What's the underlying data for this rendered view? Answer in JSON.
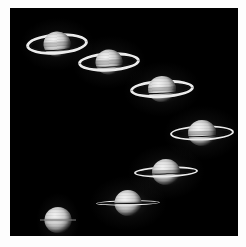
{
  "figure": {
    "kind": "astrophoto-montage",
    "orientation": "diagonal descending sequence",
    "plate_background_color": "#000000",
    "paper_background_color": "#fdfdfd",
    "plate": {
      "left": 10,
      "top": 8,
      "width": 228,
      "height": 228
    },
    "count": 7
  },
  "palette": {
    "sky": "#000000",
    "paper": "#fdfdfd",
    "globe_highlight": "#f2f2f2",
    "globe_midtone": "#c9c9c9",
    "globe_terminator": "#2a2a2a",
    "ring_bright": "#ececec",
    "ring_dark_gap": "#141414"
  },
  "saturns": [
    {
      "id": "saturn-1",
      "label": "rings wide open, north face, upper left",
      "x": 16,
      "y": 14,
      "w": 62,
      "h": 44,
      "globe_w": 27,
      "globe_h": 25,
      "ring_rx": 31,
      "ring_ry": 10.5,
      "ring_thickness": 3.6,
      "tilt_deg": -4,
      "openness": 0.95,
      "edge_on": false,
      "ring_in_front": "bottom"
    },
    {
      "id": "saturn-2",
      "label": "rings open, second step",
      "x": 68,
      "y": 32,
      "w": 62,
      "h": 44,
      "globe_w": 27,
      "globe_h": 25,
      "ring_rx": 31,
      "ring_ry": 9.5,
      "ring_thickness": 3.4,
      "tilt_deg": -3,
      "openness": 0.86,
      "edge_on": false,
      "ring_in_front": "bottom"
    },
    {
      "id": "saturn-3",
      "label": "rings open, third step",
      "x": 120,
      "y": 59,
      "w": 64,
      "h": 44,
      "globe_w": 28,
      "globe_h": 26,
      "ring_rx": 32,
      "ring_ry": 9.0,
      "ring_thickness": 3.2,
      "tilt_deg": -3,
      "openness": 0.8,
      "edge_on": false,
      "ring_in_front": "bottom"
    },
    {
      "id": "saturn-4",
      "label": "rings narrowing, fourth step, right edge",
      "x": 160,
      "y": 104,
      "w": 64,
      "h": 42,
      "globe_w": 28,
      "globe_h": 26,
      "ring_rx": 32,
      "ring_ry": 7.5,
      "ring_thickness": 2.9,
      "tilt_deg": -2,
      "openness": 0.66,
      "edge_on": false,
      "ring_in_front": "bottom"
    },
    {
      "id": "saturn-5",
      "label": "rings narrow, fifth step",
      "x": 124,
      "y": 143,
      "w": 64,
      "h": 42,
      "globe_w": 28,
      "globe_h": 26,
      "ring_rx": 32,
      "ring_ry": 5.6,
      "ring_thickness": 2.4,
      "tilt_deg": -2,
      "openness": 0.48,
      "edge_on": false,
      "ring_in_front": "bottom"
    },
    {
      "id": "saturn-6",
      "label": "rings nearly edge-on, sixth step",
      "x": 86,
      "y": 175,
      "w": 64,
      "h": 40,
      "globe_w": 27,
      "globe_h": 26,
      "ring_rx": 32,
      "ring_ry": 2.6,
      "ring_thickness": 1.6,
      "tilt_deg": -1,
      "openness": 0.2,
      "edge_on": false,
      "ring_in_front": "bottom"
    },
    {
      "id": "saturn-7",
      "label": "rings edge-on, hairline, lower left",
      "x": 30,
      "y": 196,
      "w": 36,
      "h": 32,
      "globe_w": 27,
      "globe_h": 26,
      "ring_rx": 18,
      "ring_ry": 0,
      "ring_thickness": 1.0,
      "tilt_deg": 0,
      "openness": 0.0,
      "edge_on": true,
      "ring_in_front": "bottom"
    }
  ]
}
